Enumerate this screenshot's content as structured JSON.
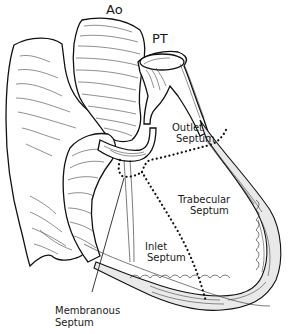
{
  "figure": {
    "type": "anatomical line drawing",
    "colors": {
      "ink": "#111111",
      "background": "#ffffff"
    }
  },
  "labels": {
    "aorta": "Ao",
    "pulmonary_trunk": "PT",
    "outlet_septum": [
      "Outlet",
      "Septum"
    ],
    "trabecular_septum": [
      "Trabecular",
      "Septum"
    ],
    "inlet_septum": [
      "Inlet",
      "Septum"
    ],
    "membranous_septum": [
      "Membranous",
      "Septum"
    ]
  }
}
